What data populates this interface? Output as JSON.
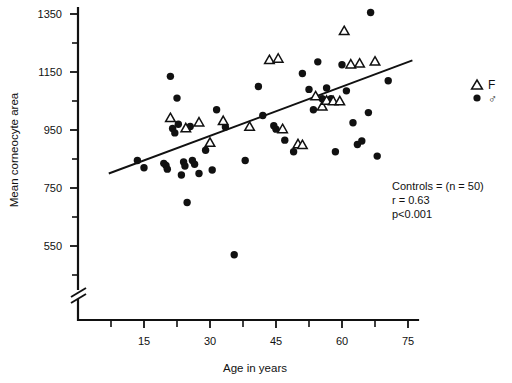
{
  "chart_data": {
    "type": "scatter",
    "title": "",
    "xlabel": "Age in years",
    "ylabel": "Mean corneocyte area",
    "xlim": [
      3,
      82
    ],
    "ylim": [
      480,
      1390
    ],
    "xticks_labeled": [
      15,
      30,
      45,
      60,
      75
    ],
    "xticks_minor": [
      7.5,
      22.5,
      37.5,
      52.5,
      67.5
    ],
    "yticks_labeled": [
      550,
      750,
      950,
      1150,
      1350
    ],
    "yticks_minor": [
      650,
      850,
      1050,
      1250
    ],
    "grid": false,
    "axis_break": {
      "axis": "y",
      "present": true,
      "note": "double-slash break below 550"
    },
    "legend": {
      "position": "right",
      "entries": [
        {
          "marker": "triangle-open",
          "label": "F"
        },
        {
          "marker": "circle-filled",
          "label": "♂"
        }
      ]
    },
    "annotations": [
      "Controls = (n = 50)",
      "r = 0.63",
      "p<0.001"
    ],
    "regression": {
      "x_start": 7.0,
      "y_start": 800,
      "x_end": 76.0,
      "y_end": 1190,
      "r": 0.63,
      "p": "<0.001",
      "n": 50
    },
    "series": [
      {
        "name": "♂",
        "marker": "circle-filled",
        "points": [
          [
            13.5,
            845
          ],
          [
            15.0,
            820
          ],
          [
            19.5,
            835
          ],
          [
            20.0,
            828
          ],
          [
            20.3,
            815
          ],
          [
            21.0,
            1135
          ],
          [
            21.5,
            955
          ],
          [
            22.0,
            940
          ],
          [
            22.5,
            1060
          ],
          [
            22.8,
            970
          ],
          [
            23.5,
            795
          ],
          [
            24.0,
            840
          ],
          [
            24.3,
            826
          ],
          [
            24.8,
            700
          ],
          [
            25.5,
            962
          ],
          [
            26.0,
            845
          ],
          [
            26.5,
            832
          ],
          [
            27.5,
            800
          ],
          [
            29.0,
            880
          ],
          [
            30.5,
            812
          ],
          [
            31.5,
            1020
          ],
          [
            33.5,
            960
          ],
          [
            35.5,
            520
          ],
          [
            38.0,
            845
          ],
          [
            41.0,
            1100
          ],
          [
            42.0,
            1000
          ],
          [
            44.5,
            965
          ],
          [
            45.0,
            953
          ],
          [
            47.0,
            915
          ],
          [
            49.0,
            875
          ],
          [
            51.0,
            1145
          ],
          [
            52.5,
            1090
          ],
          [
            53.5,
            1020
          ],
          [
            54.5,
            1185
          ],
          [
            55.5,
            1058
          ],
          [
            56.5,
            1095
          ],
          [
            57.5,
            1058
          ],
          [
            58.5,
            875
          ],
          [
            60.0,
            1175
          ],
          [
            61.0,
            1085
          ],
          [
            62.5,
            975
          ],
          [
            63.5,
            900
          ],
          [
            64.5,
            912
          ],
          [
            66.0,
            1010
          ],
          [
            66.5,
            1355
          ],
          [
            68.0,
            860
          ],
          [
            70.5,
            1120
          ]
        ]
      },
      {
        "name": "F",
        "marker": "triangle-open",
        "points": [
          [
            21.0,
            990
          ],
          [
            24.5,
            955
          ],
          [
            27.5,
            975
          ],
          [
            30.0,
            905
          ],
          [
            33.0,
            980
          ],
          [
            39.0,
            960
          ],
          [
            43.5,
            1190
          ],
          [
            45.5,
            1195
          ],
          [
            46.5,
            952
          ],
          [
            50.0,
            900
          ],
          [
            51.0,
            897
          ],
          [
            54.0,
            1065
          ],
          [
            55.5,
            1030
          ],
          [
            56.5,
            1050
          ],
          [
            58.0,
            1048
          ],
          [
            59.5,
            1048
          ],
          [
            60.5,
            1290
          ],
          [
            62.0,
            1175
          ],
          [
            64.0,
            1178
          ],
          [
            67.5,
            1185
          ]
        ]
      }
    ]
  },
  "axis": {
    "y_title": "Mean corneocyte area",
    "x_title": "Age in years",
    "y_tick_labels": [
      "1350",
      "1150",
      "950",
      "750",
      "550"
    ],
    "x_tick_labels": [
      "15",
      "30",
      "45",
      "60",
      "75"
    ]
  },
  "stats_box": {
    "controls": "Controls = (n = 50)",
    "r_value": "r = 0.63",
    "p_value": "p<0.001"
  },
  "legend": {
    "female_label": "F",
    "male_label": "♂"
  },
  "colors": {
    "ink": "#111111",
    "background": "#ffffff"
  }
}
